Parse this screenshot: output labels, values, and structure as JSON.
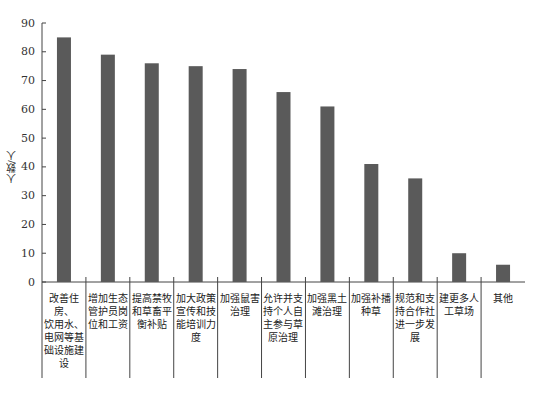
{
  "chart_data": {
    "type": "bar",
    "title": "",
    "xlabel": "",
    "ylabel": "人数/人",
    "ylim": [
      0,
      90
    ],
    "yticks": [
      0,
      10,
      20,
      30,
      40,
      50,
      60,
      70,
      80,
      90
    ],
    "grid": false,
    "legend": null,
    "bar_color": "#5a5a5a",
    "categories": [
      "改善住房、饮用水、电网等基础设施建设",
      "增加生态管护员岗位和工资",
      "提高禁牧和草畜平衡补贴",
      "加大政策宣传和技能培训力度",
      "加强鼠害治理",
      "允许并支持个人自主参与草原治理",
      "加强黑土滩治理",
      "加强补播种草",
      "规范和支持合作社进一步发展",
      "建更多人工草场",
      "其他"
    ],
    "category_lines": [
      [
        "改善住房、",
        "饮用水、",
        "电网等基",
        "础设施建",
        "设"
      ],
      [
        "增加生态",
        "管护员岗",
        "位和工资"
      ],
      [
        "提高禁牧",
        "和草畜平",
        "衡补贴"
      ],
      [
        "加大政策",
        "宣传和技",
        "能培训力",
        "度"
      ],
      [
        "加强鼠害",
        "治理"
      ],
      [
        "允许并支",
        "持个人自",
        "主参与草",
        "原治理"
      ],
      [
        "加强黑土",
        "滩治理"
      ],
      [
        "加强补播",
        "种草"
      ],
      [
        "规范和支",
        "持合作社",
        "进一步发",
        "展"
      ],
      [
        "建更多人",
        "工草场"
      ],
      [
        "其他"
      ]
    ],
    "values": [
      85,
      79,
      76,
      75,
      74,
      66,
      61,
      41,
      36,
      10,
      6
    ]
  },
  "axis": {
    "y_title": "人数/人"
  }
}
